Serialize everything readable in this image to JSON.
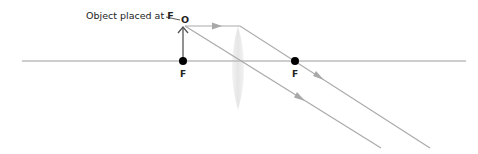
{
  "diagram": {
    "object_label_prefix": "Object placed at ",
    "object_label_bold": "F",
    "object_point_label": "O",
    "focal_left_label": "F",
    "focal_right_label": "F",
    "colors": {
      "axis": "#b8b8b8",
      "ray": "#a8a8a8",
      "lens": "#ebebeb",
      "point": "#000000",
      "text": "#222222"
    }
  }
}
